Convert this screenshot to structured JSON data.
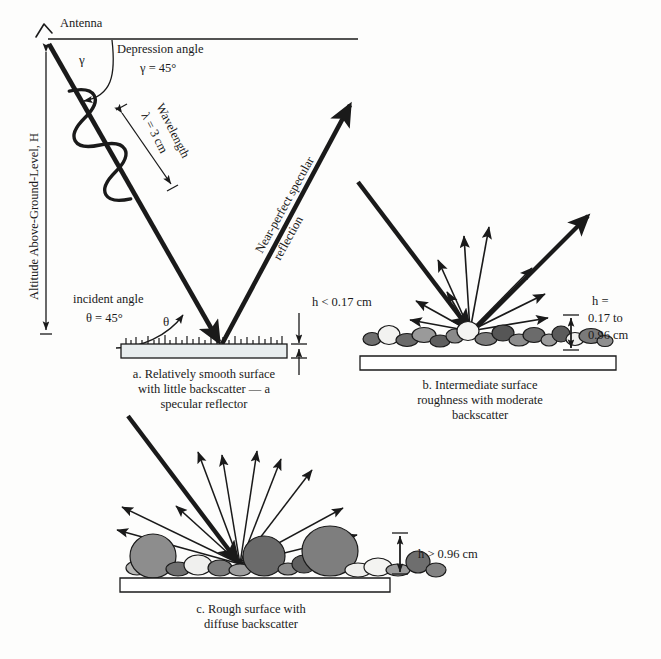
{
  "figure": {
    "title_visible": false,
    "background": "#fdfdfc",
    "ink": "#1a1a1a"
  },
  "antenna": {
    "label": "Antenna",
    "icon": "antenna-icon"
  },
  "altitude": {
    "label": "Altitude Above-Ground-Level, H"
  },
  "depression": {
    "label": "Depression angle",
    "value": "γ = 45°",
    "symbol": "γ"
  },
  "wavelength": {
    "label": "Wavelength",
    "value": "λ = 3 cm"
  },
  "incident": {
    "label": "incident angle",
    "value": "θ = 45°",
    "symbol": "θ"
  },
  "specular": {
    "label_line1": "Near-perfect specular",
    "label_line2": "reflection"
  },
  "panels": [
    {
      "id": "a",
      "height_label": [
        "h < 0.17 cm"
      ],
      "caption": [
        "a. Relatively smooth surface",
        "with little backscatter — a",
        "specular reflector"
      ],
      "surface": "smooth-slab",
      "slab_fill": "#e8edee"
    },
    {
      "id": "b",
      "height_label": [
        "h =",
        "0.17 to",
        "0.96 cm"
      ],
      "caption": [
        "b. Intermediate surface",
        "roughness with moderate",
        "backscatter"
      ],
      "surface": "pebble-bed",
      "slab_fill": "#ffffff"
    },
    {
      "id": "c",
      "height_label": [
        "h > 0.96 cm"
      ],
      "caption": [
        "c. Rough surface with",
        "diffuse backscatter"
      ],
      "surface": "boulder-bed",
      "slab_fill": "#ffffff"
    }
  ],
  "chart_data": {
    "type": "diagram",
    "wavelength_cm": 3,
    "depression_angle_deg": 45,
    "incident_angle_deg": 45,
    "roughness_thresholds_cm": {
      "smooth_max": 0.17,
      "intermediate_min": 0.17,
      "intermediate_max": 0.96,
      "rough_min": 0.96
    },
    "categories": [
      "a. smooth",
      "b. intermediate",
      "c. rough"
    ],
    "scatter_character": [
      "specular",
      "moderate backscatter",
      "diffuse backscatter"
    ]
  },
  "pebbles_b": [
    {
      "cx": 372,
      "cy": 339,
      "rx": 9,
      "ry": 6.5,
      "fill": "#6f6f6f"
    },
    {
      "cx": 389,
      "cy": 335,
      "rx": 11,
      "ry": 9.5,
      "fill": "#f2f2f0"
    },
    {
      "cx": 407,
      "cy": 340,
      "rx": 11,
      "ry": 6.5,
      "fill": "#6a6a6a"
    },
    {
      "cx": 424,
      "cy": 335,
      "rx": 12,
      "ry": 7.5,
      "fill": "#9a9a9a"
    },
    {
      "cx": 440,
      "cy": 341,
      "rx": 10,
      "ry": 6,
      "fill": "#5f5f5f"
    },
    {
      "cx": 455,
      "cy": 336,
      "rx": 9,
      "ry": 7,
      "fill": "#8a8a8a"
    },
    {
      "cx": 468,
      "cy": 331,
      "rx": 11,
      "ry": 9.5,
      "fill": "#f4f4f2"
    },
    {
      "cx": 486,
      "cy": 339,
      "rx": 11,
      "ry": 6.5,
      "fill": "#7d7d7d"
    },
    {
      "cx": 503,
      "cy": 333,
      "rx": 11,
      "ry": 8,
      "fill": "#565656"
    },
    {
      "cx": 519,
      "cy": 340,
      "rx": 10,
      "ry": 6,
      "fill": "#8e8e8e"
    },
    {
      "cx": 534,
      "cy": 335,
      "rx": 11,
      "ry": 7.5,
      "fill": "#6b6b6b"
    },
    {
      "cx": 549,
      "cy": 340,
      "rx": 8,
      "ry": 6,
      "fill": "#9c9c9c"
    },
    {
      "cx": 561,
      "cy": 334,
      "rx": 9,
      "ry": 8,
      "fill": "#5b5b5b"
    },
    {
      "cx": 575,
      "cy": 339,
      "rx": 9,
      "ry": 6.5,
      "fill": "#efefed"
    },
    {
      "cx": 591,
      "cy": 336,
      "rx": 12,
      "ry": 7.5,
      "fill": "#7a7a7a"
    },
    {
      "cx": 605,
      "cy": 341,
      "rx": 8,
      "ry": 5.5,
      "fill": "#8f8f8f"
    }
  ],
  "pebbles_c": [
    {
      "cx": 137,
      "cy": 568,
      "rx": 11,
      "ry": 7,
      "fill": "#b5b5b3"
    },
    {
      "cx": 153,
      "cy": 556,
      "rx": 23,
      "ry": 22,
      "fill": "#8d8d8d"
    },
    {
      "cx": 178,
      "cy": 569,
      "rx": 12,
      "ry": 7,
      "fill": "#707070"
    },
    {
      "cx": 198,
      "cy": 565,
      "rx": 14,
      "ry": 10,
      "fill": "#f0f0ee"
    },
    {
      "cx": 220,
      "cy": 568,
      "rx": 12,
      "ry": 8,
      "fill": "#7c7c7c"
    },
    {
      "cx": 240,
      "cy": 570,
      "rx": 11,
      "ry": 6,
      "fill": "#9e9e9e"
    },
    {
      "cx": 264,
      "cy": 556,
      "rx": 21,
      "ry": 20,
      "fill": "#6a6a6a"
    },
    {
      "cx": 288,
      "cy": 569,
      "rx": 10,
      "ry": 6,
      "fill": "#8a8a8a"
    },
    {
      "cx": 304,
      "cy": 564,
      "rx": 12,
      "ry": 9,
      "fill": "#606060"
    },
    {
      "cx": 330,
      "cy": 551,
      "rx": 28,
      "ry": 25,
      "fill": "#7e7e7e"
    },
    {
      "cx": 358,
      "cy": 570,
      "rx": 13,
      "ry": 7,
      "fill": "#efefed"
    },
    {
      "cx": 378,
      "cy": 567,
      "rx": 14,
      "ry": 9,
      "fill": "#f3f3f1"
    },
    {
      "cx": 398,
      "cy": 570,
      "rx": 12,
      "ry": 6,
      "fill": "#9b9b9b"
    },
    {
      "cx": 418,
      "cy": 562,
      "rx": 12,
      "ry": 11,
      "fill": "#6e6e6e"
    },
    {
      "cx": 436,
      "cy": 570,
      "rx": 10,
      "ry": 7,
      "fill": "#828282"
    }
  ]
}
